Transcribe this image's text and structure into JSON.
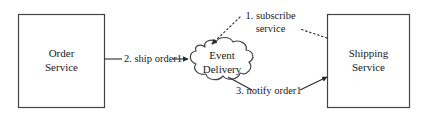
{
  "diagram": {
    "background_color": "#ffffff",
    "stroke_color": "#444444",
    "text_color": "#1a1a1a",
    "nodes": [
      {
        "id": "order-service",
        "shape": "rectangle",
        "line_1": "Order",
        "line_2": "Service"
      },
      {
        "id": "event-delivery",
        "shape": "cloud",
        "line_1": "Event",
        "line_2": "Delivery"
      },
      {
        "id": "shipping-service",
        "shape": "rectangle",
        "line_1": "Shipping",
        "line_2": "Service"
      }
    ],
    "edges": [
      {
        "id": "subscribe",
        "line_1": "1. subscribe",
        "line_2": "service",
        "style": "dotted",
        "from": "shipping-service",
        "to": "event-delivery"
      },
      {
        "id": "ship-order",
        "line_1": "2. ship order1",
        "style": "solid",
        "from": "order-service",
        "to": "event-delivery"
      },
      {
        "id": "notify-order",
        "line_1": "3. notify order1",
        "style": "solid",
        "from": "event-delivery",
        "to": "shipping-service"
      }
    ]
  }
}
